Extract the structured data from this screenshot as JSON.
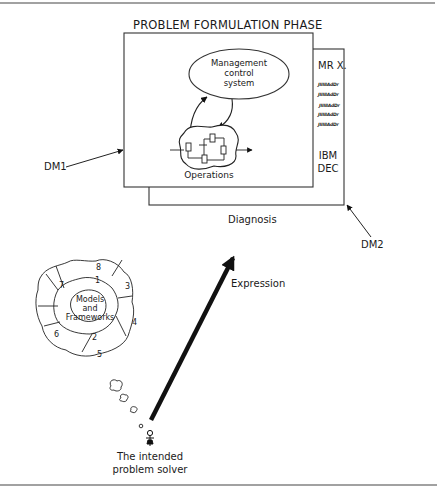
{
  "title": "PROBLEM FORMULATION PHASE",
  "front_panel": {
    "ellipse_label": [
      "Management",
      "control",
      "system"
    ],
    "operations_label": "Operations"
  },
  "side_panel": {
    "header": "MR X.",
    "scribbles": [
      "JIIIIIAdDr",
      "JIIIIIAdDr",
      "JIIIIIAdDr",
      "JIIIIIAdDr",
      "JIIIIIAdDr"
    ],
    "footer": [
      "IBM",
      "DEC"
    ]
  },
  "labels": {
    "diagnosis": "Diagnosis",
    "dm1": "DM1",
    "dm2": "DM2",
    "expression": "Expression",
    "solver": [
      "The intended",
      "problem solver"
    ]
  },
  "thought_cloud": {
    "center": [
      "Models",
      "and",
      "Frameworks"
    ],
    "segments": [
      "1",
      "2",
      "3",
      "4",
      "5",
      "6",
      "7",
      "8"
    ]
  },
  "colors": {
    "line": "#333333",
    "arrow": "#111111",
    "background": "#ffffff"
  }
}
